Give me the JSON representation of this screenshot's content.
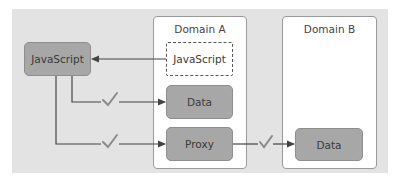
{
  "diagram": {
    "panel_color": "#e3e3e3",
    "box_color": "#a7a7a7",
    "check_color": "#8a8a8a",
    "domains": [
      {
        "id": "domain-a",
        "title": "Domain A"
      },
      {
        "id": "domain-b",
        "title": "Domain B"
      }
    ],
    "nodes": {
      "client_js": "JavaScript",
      "domain_a_js": "JavaScript",
      "domain_a_data": "Data",
      "domain_a_proxy": "Proxy",
      "domain_b_data": "Data"
    },
    "edges": [
      {
        "from": "domain_a_js",
        "to": "client_js",
        "style": "arrow",
        "check": false
      },
      {
        "from": "client_js",
        "to": "domain_a_data",
        "style": "arrow",
        "check": true
      },
      {
        "from": "client_js",
        "to": "domain_a_proxy",
        "style": "arrow",
        "check": true
      },
      {
        "from": "domain_a_proxy",
        "to": "domain_b_data",
        "style": "arrow",
        "check": true
      }
    ]
  }
}
